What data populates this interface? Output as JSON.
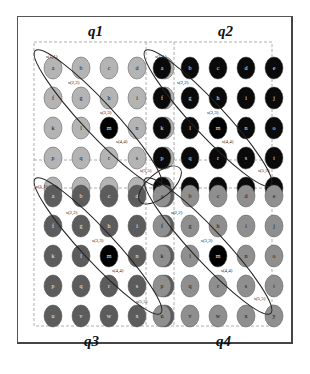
{
  "diagram": {
    "quadrants": [
      {
        "id": "q1",
        "label": "q1",
        "node_color": "#a9a9a9",
        "title_pos": "top"
      },
      {
        "id": "q2",
        "label": "q2",
        "node_color": "#0a0a0a",
        "title_pos": "top"
      },
      {
        "id": "q3",
        "label": "q3",
        "node_color": "#5f5f5f",
        "title_pos": "bottom"
      },
      {
        "id": "q4",
        "label": "q4",
        "node_color": "#9a9a9a",
        "title_pos": "bottom"
      }
    ],
    "node_labels": [
      "a",
      "b",
      "c",
      "d",
      "e",
      "f",
      "g",
      "h",
      "i",
      "j",
      "k",
      "l",
      "m",
      "n",
      "o",
      "p",
      "q",
      "r",
      "s",
      "t",
      "u",
      "v",
      "w",
      "x",
      "y"
    ],
    "highlight_node": "m",
    "highlight_color": "#000000",
    "diagonal_labels": [
      "s(1,1)",
      "s(2,2)",
      "s(3,3)",
      "s(4,4)",
      "s(5,5)"
    ],
    "q2_diagonal_labels": [
      "s(1,1)",
      "s(2,2)",
      "s(3,3)",
      "s (4,4)",
      "s(5,5)"
    ],
    "colors": {
      "light_gray": "#b4b4b4",
      "mid_gray": "#8f8f8f",
      "dark_gray": "#5c5c5c",
      "black": "#0a0a0a",
      "dashed_border": "#999999",
      "ellipse_stroke": "#222222"
    }
  }
}
